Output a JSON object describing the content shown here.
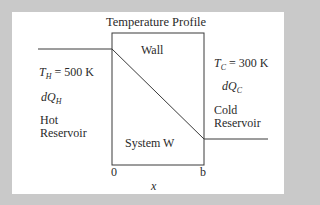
{
  "diagram": {
    "title": "Temperature Profile",
    "wall_label": "Wall",
    "system_label": "System W",
    "hot": {
      "temp_symbol": "T",
      "temp_sub": "H",
      "temp_value": " = 500 K",
      "heat_symbol": "dQ",
      "heat_sub": "H",
      "label_line1": "Hot",
      "label_line2": "Reservoir"
    },
    "cold": {
      "temp_symbol": "T",
      "temp_sub": "C",
      "temp_value": " = 300 K",
      "heat_symbol": "dQ",
      "heat_sub": "C",
      "label_line1": "Cold",
      "label_line2": "Reservoir"
    },
    "axis": {
      "start": "0",
      "end": "b",
      "label": "x"
    },
    "colors": {
      "background": "#c9c9c9",
      "panel": "#ffffff",
      "stroke": "#3a3a3a"
    }
  }
}
